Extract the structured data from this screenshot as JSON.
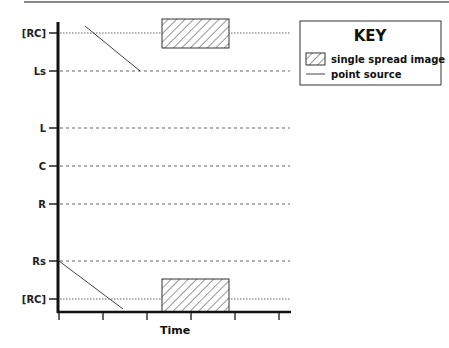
{
  "diagram": {
    "type": "timeline-panning-diagram",
    "x_axis": {
      "label": "Time",
      "ticks": 6
    },
    "y_axis": {
      "labels": [
        "[RC]",
        "Ls",
        "L",
        "C",
        "R",
        "Rs",
        "[RC]"
      ]
    },
    "key": {
      "title": "KEY",
      "items": [
        {
          "symbol": "hatched-box",
          "label": "single spread image"
        },
        {
          "symbol": "line",
          "label": "point source"
        }
      ]
    },
    "elements": [
      {
        "kind": "single spread image",
        "row": "[RC] (top)",
        "x_start_tick": 2.35,
        "x_end_tick": 3.85
      },
      {
        "kind": "single spread image",
        "row": "[RC] (bottom)",
        "x_start_tick": 2.35,
        "x_end_tick": 3.85
      },
      {
        "kind": "point source",
        "from": "[RC] (top)",
        "to": "Ls"
      },
      {
        "kind": "point source",
        "from": "Rs",
        "to": "[RC] (bottom)"
      }
    ]
  }
}
